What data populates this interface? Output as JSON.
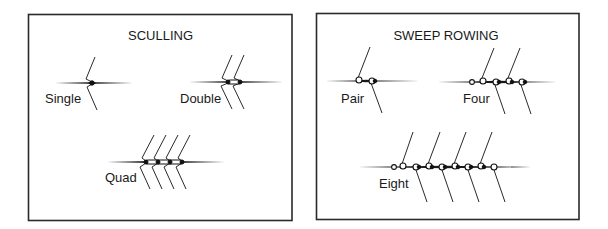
{
  "panels": [
    {
      "id": "sculling",
      "title": "SCULLING",
      "boats": [
        {
          "label": "Single",
          "rowers": 1,
          "oars_per_rower": 2,
          "coxswain": false
        },
        {
          "label": "Double",
          "rowers": 2,
          "oars_per_rower": 2,
          "coxswain": false
        },
        {
          "label": "Quad",
          "rowers": 4,
          "oars_per_rower": 2,
          "coxswain": false
        }
      ]
    },
    {
      "id": "sweep",
      "title": "SWEEP ROWING",
      "boats": [
        {
          "label": "Pair",
          "rowers": 2,
          "oars_per_rower": 1,
          "coxswain": false
        },
        {
          "label": "Four",
          "rowers": 4,
          "oars_per_rower": 1,
          "coxswain": true
        },
        {
          "label": "Eight",
          "rowers": 8,
          "oars_per_rower": 1,
          "coxswain": true
        }
      ]
    }
  ],
  "colors": {
    "line": "#2a2a2a",
    "background": "#ffffff"
  }
}
